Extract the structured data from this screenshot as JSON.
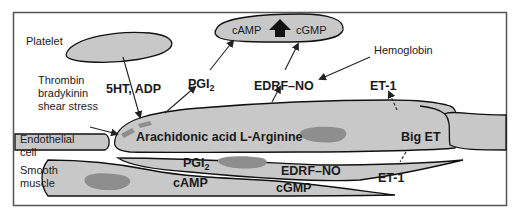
{
  "diagram": {
    "colors": {
      "cell_fill": "#c8c8c8",
      "nucleus_fill": "#8e8e8e",
      "outline": "#111111",
      "frame": "#555555",
      "background": "#ffffff"
    },
    "regions": {
      "platelet": "Platelet",
      "endothelial_1": "Endothelial",
      "endothelial_2": "cell",
      "smooth_1": "Smooth",
      "smooth_2": "muscle"
    },
    "stimuli": {
      "line1": "Thrombin",
      "line2": "bradykinin",
      "line3": "shear stress"
    },
    "platelet_cell": {
      "camp": "cAMP",
      "cgmp": "cGMP",
      "up_arrow": "increase"
    },
    "mediators": {
      "serotonin_adp": "5HT, ADP",
      "pgi2_top": "PGI",
      "pgi2_top_sub": "2",
      "edrf_top": "EDRF–NO",
      "hemoglobin": "Hemoglobin",
      "et1_top": "ET-1"
    },
    "endothelium": {
      "arachidonic": "Arachidonic acid",
      "arginine": "L-Arginine",
      "big_et": "Big ET"
    },
    "smooth_muscle": {
      "pgi2": "PGI",
      "pgi2_sub": "2",
      "camp": "cAMP",
      "edrf": "EDRF–NO",
      "cgmp": "cGMP",
      "et1": "ET-1"
    }
  }
}
